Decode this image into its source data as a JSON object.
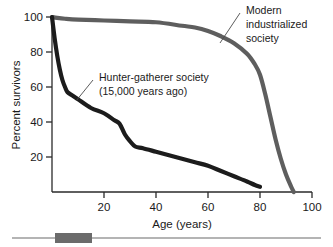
{
  "chart_data": {
    "type": "line",
    "title": "",
    "xlabel": "Age (years)",
    "ylabel": "Percent survivors",
    "xlim": [
      0,
      100
    ],
    "ylim": [
      0,
      100
    ],
    "xticks": [
      "20",
      "40",
      "60",
      "80",
      "100"
    ],
    "xtick_values": [
      20,
      40,
      60,
      80,
      100
    ],
    "yticks": [
      "20",
      "40",
      "60",
      "80",
      "100"
    ],
    "ytick_values": [
      20,
      40,
      60,
      80,
      100
    ],
    "grid": false,
    "legend": "none",
    "series": [
      {
        "name": "Modern industrialized society",
        "color": "#5e5e5e",
        "x": [
          0,
          2,
          5,
          10,
          20,
          30,
          40,
          50,
          55,
          60,
          65,
          70,
          75,
          78,
          80,
          82,
          84,
          86,
          88,
          90,
          92,
          93
        ],
        "values": [
          100,
          99.5,
          99,
          98.5,
          98,
          97.5,
          97,
          95,
          94,
          92,
          89,
          85,
          79,
          73,
          67,
          56,
          43,
          30,
          19,
          10,
          3,
          0
        ]
      },
      {
        "name": "Hunter-gatherer society (15,000 years ago)",
        "color": "#1c1c1c",
        "x": [
          0,
          1,
          2,
          3,
          4,
          5,
          6,
          8,
          10,
          15,
          20,
          24,
          26,
          28,
          30,
          32,
          35,
          40,
          45,
          50,
          55,
          60,
          65,
          70,
          75,
          78,
          80
        ],
        "values": [
          100,
          88,
          78,
          70,
          64,
          60,
          57,
          55,
          53,
          48,
          45,
          41,
          39,
          33,
          29,
          26,
          25,
          23,
          21,
          19,
          17,
          15,
          12,
          9,
          6,
          4,
          3
        ]
      }
    ],
    "annotations": [
      {
        "id": "modern-label",
        "lines": [
          "Modern",
          "industrialized",
          "society"
        ],
        "points_to": "Modern industrialized society"
      },
      {
        "id": "hunter-gatherer-label",
        "lines": [
          "Hunter-gatherer society",
          "(15,000 years ago)"
        ],
        "points_to": "Hunter-gatherer society (15,000 years ago)"
      }
    ]
  },
  "footer": {
    "rule_accent_color": "#6b6b6b",
    "rule_line_color": "#6b6b6b"
  }
}
